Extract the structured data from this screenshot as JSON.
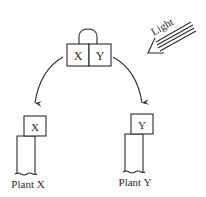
{
  "diagram": {
    "source_box": {
      "left_label": "X",
      "right_label": "Y"
    },
    "light": {
      "label": "Light",
      "direction": "from upper-right toward source box"
    },
    "plants": [
      {
        "name": "Plant X",
        "head_label": "X",
        "leans": "left"
      },
      {
        "name": "Plant Y",
        "head_label": "Y",
        "leans": "right"
      }
    ],
    "arrows": [
      {
        "from": "source_box",
        "to": "Plant X"
      },
      {
        "from": "source_box",
        "to": "Plant Y"
      }
    ],
    "colors": {
      "ink": "#2a2a2a",
      "background": "#ffffff"
    }
  }
}
